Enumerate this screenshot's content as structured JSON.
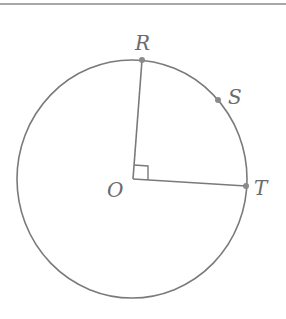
{
  "figure": {
    "type": "circle-geometry",
    "colors": {
      "stroke": "#7a7a7a",
      "label": "#6b6b6b",
      "rule": "#8a8a8a",
      "background": "#ffffff"
    },
    "circle": {
      "center_label": "O",
      "cx": 132,
      "cy": 179,
      "rx": 115,
      "ry": 119
    },
    "points": [
      {
        "name": "R",
        "label": "R",
        "x": 142,
        "y": 60
      },
      {
        "name": "S",
        "label": "S",
        "x": 218,
        "y": 100
      },
      {
        "name": "T",
        "label": "T",
        "x": 246,
        "y": 186
      },
      {
        "name": "O",
        "label": "O",
        "x": 133,
        "y": 179
      }
    ],
    "segments": [
      {
        "from": "O",
        "to": "R"
      },
      {
        "from": "O",
        "to": "T"
      }
    ],
    "right_angle_at": "O"
  }
}
